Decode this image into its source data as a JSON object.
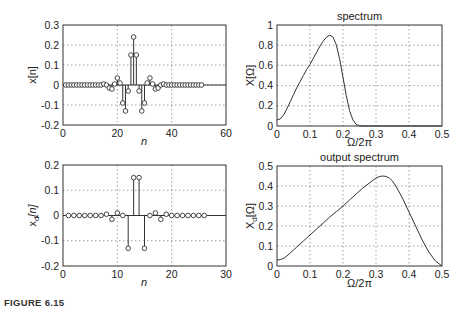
{
  "figure": {
    "caption": "FIGURE 6.15"
  },
  "chart_data": [
    {
      "type": "stem",
      "id": "x",
      "title": "",
      "xlabel": "n",
      "ylabel": "x[n]",
      "xlim": [
        0,
        60
      ],
      "ylim": [
        -0.2,
        0.3
      ],
      "xticks": [
        0,
        20,
        40,
        60
      ],
      "yticks": [
        -0.2,
        -0.1,
        0,
        0.1,
        0.2,
        0.3
      ],
      "grid": true,
      "n": [
        1,
        2,
        3,
        4,
        5,
        6,
        7,
        8,
        9,
        10,
        11,
        12,
        13,
        14,
        15,
        16,
        17,
        18,
        19,
        20,
        21,
        22,
        23,
        24,
        25,
        26,
        27,
        28,
        29,
        30,
        31,
        32,
        33,
        34,
        35,
        36,
        37,
        38,
        39,
        40,
        41,
        42,
        43,
        44,
        45,
        46,
        47,
        48,
        49,
        50,
        51
      ],
      "values": [
        0,
        0,
        0,
        0,
        0,
        0,
        0,
        0,
        0,
        0,
        0,
        0,
        0,
        0,
        0.005,
        0,
        -0.015,
        -0.02,
        0.005,
        0.035,
        0.01,
        -0.09,
        -0.13,
        -0.03,
        0.15,
        0.24,
        0.15,
        -0.03,
        -0.13,
        -0.09,
        0.01,
        0.035,
        0.005,
        -0.02,
        -0.015,
        0,
        0.005,
        0,
        0,
        0,
        0,
        0,
        0,
        0,
        0,
        0,
        0,
        0,
        0,
        0,
        0
      ]
    },
    {
      "type": "line",
      "id": "X",
      "title": "spectrum",
      "xlabel": "Ω/2π",
      "ylabel": "X[Ω]",
      "xlim": [
        0,
        0.5
      ],
      "ylim": [
        0,
        1
      ],
      "xticks": [
        0,
        0.1,
        0.2,
        0.3,
        0.4,
        0.5
      ],
      "yticks": [
        0,
        0.2,
        0.4,
        0.6,
        0.8,
        1
      ],
      "grid": true,
      "x": [
        0,
        0.01,
        0.02,
        0.03,
        0.04,
        0.05,
        0.06,
        0.07,
        0.08,
        0.09,
        0.1,
        0.11,
        0.12,
        0.13,
        0.14,
        0.15,
        0.16,
        0.17,
        0.18,
        0.19,
        0.2,
        0.21,
        0.22,
        0.23,
        0.24,
        0.25,
        0.26,
        0.3,
        0.4,
        0.5
      ],
      "values": [
        0.06,
        0.07,
        0.11,
        0.17,
        0.24,
        0.31,
        0.38,
        0.44,
        0.5,
        0.56,
        0.61,
        0.67,
        0.73,
        0.79,
        0.84,
        0.88,
        0.9,
        0.88,
        0.8,
        0.66,
        0.48,
        0.3,
        0.15,
        0.06,
        0.015,
        0.003,
        0,
        0,
        0,
        0
      ]
    },
    {
      "type": "stem",
      "id": "xd",
      "title": "",
      "xlabel": "n",
      "ylabel": "x_d[n]",
      "ylabel_main": "x",
      "ylabel_sub": "d",
      "ylabel_rest": "[n]",
      "xlim": [
        0,
        30
      ],
      "ylim": [
        -0.2,
        0.2
      ],
      "xticks": [
        0,
        10,
        20,
        30
      ],
      "yticks": [
        -0.2,
        -0.1,
        0,
        0.1,
        0.2
      ],
      "grid": true,
      "n": [
        1,
        2,
        3,
        4,
        5,
        6,
        7,
        8,
        9,
        10,
        11,
        12,
        13,
        14,
        15,
        16,
        17,
        18,
        19,
        20,
        21,
        22,
        23,
        24,
        25,
        26
      ],
      "values": [
        0,
        0,
        0,
        0,
        0,
        0,
        0,
        0.005,
        -0.015,
        0.01,
        0,
        -0.13,
        0.15,
        0.15,
        -0.13,
        0,
        0.01,
        -0.015,
        0.005,
        0,
        0,
        0,
        0,
        0,
        0,
        0
      ]
    },
    {
      "type": "line",
      "id": "Xd",
      "title": "output spectrum",
      "xlabel": "Ω/2π",
      "ylabel": "X_d[Ω]",
      "ylabel_main": "X",
      "ylabel_sub": "d",
      "ylabel_rest": "[Ω]",
      "xlim": [
        0,
        0.5
      ],
      "ylim": [
        0,
        0.5
      ],
      "xticks": [
        0,
        0.1,
        0.2,
        0.3,
        0.4,
        0.5
      ],
      "yticks": [
        0,
        0.1,
        0.2,
        0.3,
        0.4,
        0.5
      ],
      "grid": true,
      "x": [
        0,
        0.01,
        0.02,
        0.03,
        0.04,
        0.05,
        0.06,
        0.08,
        0.1,
        0.12,
        0.14,
        0.16,
        0.18,
        0.2,
        0.22,
        0.24,
        0.26,
        0.28,
        0.3,
        0.31,
        0.32,
        0.33,
        0.34,
        0.35,
        0.36,
        0.38,
        0.4,
        0.42,
        0.44,
        0.46,
        0.48,
        0.5
      ],
      "values": [
        0.03,
        0.032,
        0.038,
        0.05,
        0.065,
        0.08,
        0.095,
        0.125,
        0.155,
        0.185,
        0.215,
        0.245,
        0.272,
        0.3,
        0.33,
        0.36,
        0.39,
        0.415,
        0.44,
        0.447,
        0.45,
        0.448,
        0.44,
        0.425,
        0.4,
        0.34,
        0.27,
        0.2,
        0.13,
        0.07,
        0.025,
        0
      ]
    }
  ],
  "panels": {
    "tl": {
      "xlabel": "n",
      "ylabel": "x[n]",
      "xticks": [
        "0",
        "20",
        "40",
        "60"
      ],
      "yticks": [
        "-0.2",
        "-0.1",
        "0",
        "0.1",
        "0.2",
        "0.3"
      ]
    },
    "tr": {
      "title": "spectrum",
      "xlabel": "Ω/2π",
      "ylabel": "X[Ω]",
      "xticks": [
        "0",
        "0.1",
        "0.2",
        "0.3",
        "0.4",
        "0.5"
      ],
      "yticks": [
        "0",
        "0.2",
        "0.4",
        "0.6",
        "0.8",
        "1"
      ]
    },
    "bl": {
      "xlabel": "n",
      "ylabel_main": "x",
      "ylabel_sub": "d",
      "ylabel_rest": "[n]",
      "xticks": [
        "0",
        "10",
        "20",
        "30"
      ],
      "yticks": [
        "-0.2",
        "-0.1",
        "0",
        "0.1",
        "0.2"
      ]
    },
    "br": {
      "title": "output spectrum",
      "xlabel": "Ω/2π",
      "ylabel_main": "X",
      "ylabel_sub": "d",
      "ylabel_rest": "[Ω]",
      "xticks": [
        "0",
        "0.1",
        "0.2",
        "0.3",
        "0.4",
        "0.5"
      ],
      "yticks": [
        "0",
        "0.1",
        "0.2",
        "0.3",
        "0.4",
        "0.5"
      ]
    }
  }
}
